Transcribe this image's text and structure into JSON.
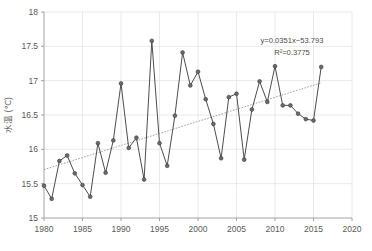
{
  "chart_data": {
    "type": "line",
    "title": "",
    "xlabel": "",
    "ylabel": "水温 (℃)",
    "xlim": [
      1980,
      2020
    ],
    "ylim": [
      15,
      18
    ],
    "xticks": [
      1980,
      1985,
      1990,
      1995,
      2000,
      2005,
      2010,
      2015,
      2020
    ],
    "yticks": [
      15,
      15.5,
      16,
      16.5,
      17,
      17.5,
      18
    ],
    "grid": true,
    "legend": "none",
    "markers": "circle",
    "series": [
      {
        "name": "水温",
        "x": [
          1980,
          1981,
          1982,
          1983,
          1984,
          1985,
          1986,
          1987,
          1988,
          1989,
          1990,
          1991,
          1992,
          1993,
          1994,
          1995,
          1996,
          1997,
          1998,
          1999,
          2000,
          2001,
          2002,
          2003,
          2004,
          2005,
          2006,
          2007,
          2008,
          2009,
          2010,
          2011,
          2012,
          2013,
          2014,
          2015,
          2016
        ],
        "values": [
          15.47,
          15.28,
          15.83,
          15.91,
          15.65,
          15.48,
          15.31,
          16.09,
          15.66,
          16.13,
          16.96,
          16.02,
          16.17,
          15.56,
          17.58,
          16.09,
          15.76,
          16.49,
          17.41,
          16.93,
          17.13,
          16.73,
          16.37,
          15.87,
          16.76,
          16.81,
          15.85,
          16.58,
          16.99,
          16.69,
          17.21,
          16.64,
          16.64,
          16.52,
          16.44,
          16.42,
          17.2
        ]
      }
    ],
    "trendline": {
      "name": "linear-trend",
      "slope": 0.0351,
      "intercept": -53.793,
      "r_squared": 0.3775,
      "equation_label": "y=0.0351x−53.793",
      "r2_label": "R²=0.3775",
      "x_start": 1980,
      "x_end": 2016
    },
    "colors": {
      "data_line": "#4d4d4d",
      "marker": "#6b6b6b",
      "trend_line": "#8c8c8c",
      "gridline": "#e4e4e4",
      "axis": "#9a9a9a",
      "text": "#5a5a5a",
      "background": "#ffffff"
    }
  },
  "axes": {
    "y_title": "水温 (℃)",
    "y_tick_labels": [
      "18",
      "17.5",
      "17",
      "16.5",
      "16",
      "15.5",
      "15"
    ],
    "x_tick_labels": [
      "1980",
      "1985",
      "1990",
      "1995",
      "2000",
      "2005",
      "2010",
      "2015",
      "2020"
    ]
  },
  "annotations": {
    "equation": "y=0.0351x−53.793",
    "r_squared": "R²=0.3775"
  }
}
